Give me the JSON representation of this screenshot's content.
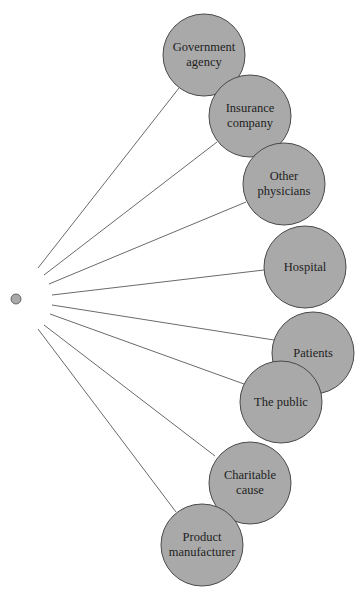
{
  "diagram": {
    "type": "radial-stakeholder-diagram",
    "colors": {
      "node_fill": "#a9a9a9",
      "node_stroke": "#4a4a4a",
      "line": "#6a6a6a",
      "background": "#ffffff"
    },
    "source": {
      "name": "center-dot",
      "cx": 16,
      "cy": 299,
      "r": 5
    },
    "nodes": [
      {
        "id": "government-agency",
        "lines": [
          "Government",
          "agency"
        ],
        "cx": 204,
        "cy": 55,
        "r": 41,
        "line_start": [
          38,
          268
        ],
        "line_end": [
          179,
          88
        ]
      },
      {
        "id": "insurance-company",
        "lines": [
          "Insurance",
          "company"
        ],
        "cx": 250,
        "cy": 116,
        "r": 41,
        "line_start": [
          44,
          275
        ],
        "line_end": [
          217,
          142
        ]
      },
      {
        "id": "other-physicians",
        "lines": [
          "Other",
          "physicians"
        ],
        "cx": 284,
        "cy": 184,
        "r": 41,
        "line_start": [
          49,
          284
        ],
        "line_end": [
          246,
          202
        ]
      },
      {
        "id": "hospital",
        "lines": [
          "Hospital"
        ],
        "cx": 305,
        "cy": 267,
        "r": 41,
        "line_start": [
          52,
          295
        ],
        "line_end": [
          264,
          270
        ]
      },
      {
        "id": "patients",
        "lines": [
          "Patients"
        ],
        "cx": 313,
        "cy": 353,
        "r": 41,
        "line_start": [
          52,
          305
        ],
        "line_end": [
          274,
          340
        ]
      },
      {
        "id": "the-public",
        "lines": [
          "The public"
        ],
        "cx": 281,
        "cy": 402,
        "r": 41,
        "line_start": [
          50,
          314
        ],
        "line_end": [
          244,
          384
        ]
      },
      {
        "id": "charitable-cause",
        "lines": [
          "Charitable",
          "cause"
        ],
        "cx": 250,
        "cy": 483,
        "r": 41,
        "line_start": [
          44,
          325
        ],
        "line_end": [
          215,
          456
        ]
      },
      {
        "id": "product-manufacturer",
        "lines": [
          "Product",
          "manufacturer"
        ],
        "cx": 202,
        "cy": 545,
        "r": 41,
        "line_start": [
          38,
          329
        ],
        "line_end": [
          176,
          512
        ]
      }
    ]
  }
}
